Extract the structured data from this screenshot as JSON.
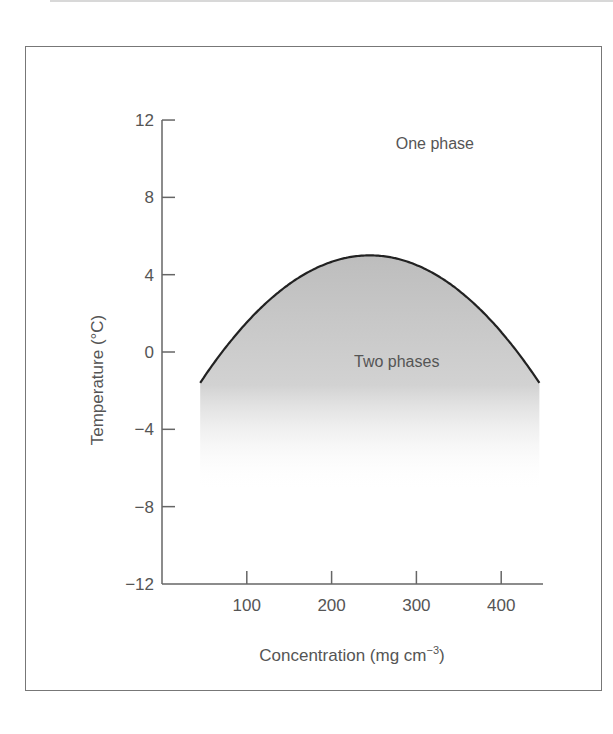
{
  "chart_data": {
    "type": "area",
    "title": "",
    "xlabel": "Concentration (mg cm",
    "xlabel_sup": "−3",
    "xlabel_end": ")",
    "ylabel": "Temperature (°C)",
    "xlim": [
      0,
      450
    ],
    "ylim": [
      -12,
      12
    ],
    "x_ticks": [
      100,
      200,
      300,
      400
    ],
    "y_ticks": [
      12,
      8,
      4,
      0,
      -4,
      -8,
      -12
    ],
    "y_tick_labels": [
      "12",
      "8",
      "4",
      "0",
      "−4",
      "−8",
      "−12"
    ],
    "series": [
      {
        "name": "Coexistence curve",
        "x": [
          45,
          100,
          150,
          200,
          250,
          300,
          350,
          400,
          445
        ],
        "y": [
          -1.6,
          1.3,
          3.5,
          4.7,
          5.0,
          4.6,
          3.2,
          0.9,
          -1.6
        ]
      }
    ],
    "annotations": [
      {
        "text": "One phase",
        "x": 310,
        "y": 10.5
      },
      {
        "text": "Two phases",
        "x": 265,
        "y": -0.8
      }
    ],
    "grid": false,
    "legend": "none",
    "colors": {
      "curve": "#222222",
      "fill": "#c8c8c8",
      "axis": "#666666",
      "text": "#555555"
    }
  }
}
